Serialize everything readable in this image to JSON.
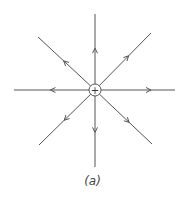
{
  "diagram": {
    "charge": {
      "symbol": "+",
      "sign": "positive",
      "cx": 95,
      "cy": 90,
      "r": 6
    },
    "line_color": "#555555",
    "field_lines": [
      {
        "direction": "up",
        "x2": 95,
        "y2": 14,
        "arrow_at": 0.55
      },
      {
        "direction": "down",
        "x2": 95,
        "y2": 167,
        "arrow_at": 0.55
      },
      {
        "direction": "left",
        "x2": 14,
        "y2": 90,
        "arrow_at": 0.55
      },
      {
        "direction": "right",
        "x2": 175,
        "y2": 90,
        "arrow_at": 0.7
      },
      {
        "direction": "upper-left",
        "x2": 38,
        "y2": 37,
        "arrow_at": 0.55
      },
      {
        "direction": "upper-right",
        "x2": 151,
        "y2": 33,
        "arrow_at": 0.6
      },
      {
        "direction": "lower-left",
        "x2": 39,
        "y2": 145,
        "arrow_at": 0.55
      },
      {
        "direction": "lower-right",
        "x2": 152,
        "y2": 144,
        "arrow_at": 0.6
      }
    ],
    "caption": "(a)"
  }
}
